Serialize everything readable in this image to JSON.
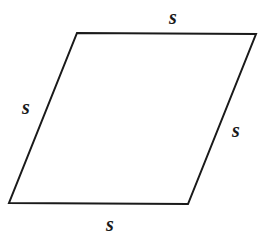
{
  "figure": {
    "shape": "rhombus",
    "stroke_color": "#1a1a1a",
    "vertices": [
      [
        77,
        33
      ],
      [
        256,
        34
      ],
      [
        188,
        204
      ],
      [
        9,
        203
      ]
    ],
    "labels": {
      "top": "s",
      "left": "s",
      "right": "s",
      "bottom": "s"
    }
  }
}
